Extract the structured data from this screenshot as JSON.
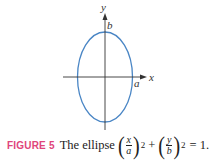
{
  "figure": {
    "axis_labels": {
      "x": "x",
      "y": "y"
    },
    "point_labels": {
      "a": "a",
      "b": "b"
    },
    "ellipse_color": "#4a86c5",
    "axis_color": "#333333"
  },
  "caption": {
    "label": "FIGURE 5",
    "label_color": "#e0457b",
    "text": "The ellipse",
    "equation": {
      "term1": {
        "num": "x",
        "den": "a",
        "exp": "2"
      },
      "plus": "+",
      "term2": {
        "num": "y",
        "den": "b",
        "exp": "2"
      },
      "rhs": "= 1."
    }
  }
}
